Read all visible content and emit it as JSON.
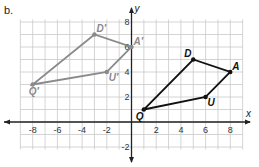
{
  "part_label": "b.",
  "axes": {
    "x_label": "x",
    "y_label": "y",
    "x_ticks": [
      {
        "value": -8,
        "label": "-8"
      },
      {
        "value": -6,
        "label": "-6"
      },
      {
        "value": -4,
        "label": "-4"
      },
      {
        "value": -2,
        "label": "-2"
      },
      {
        "value": 2,
        "label": "2"
      },
      {
        "value": 4,
        "label": "4"
      },
      {
        "value": 6,
        "label": "6"
      },
      {
        "value": 8,
        "label": "8"
      }
    ],
    "y_ticks": [
      {
        "value": 8,
        "label": "8"
      },
      {
        "value": 6,
        "label": "6"
      },
      {
        "value": 4,
        "label": "4"
      },
      {
        "value": 2,
        "label": "2"
      },
      {
        "value": -2,
        "label": "-2"
      }
    ],
    "xlim": [
      -9,
      9
    ],
    "ylim": [
      -2,
      8
    ]
  },
  "figures": [
    {
      "name": "original",
      "color": "#111111",
      "vertices": [
        {
          "label": "Q",
          "x": 1,
          "y": 1
        },
        {
          "label": "U",
          "x": 6,
          "y": 2
        },
        {
          "label": "A",
          "x": 8,
          "y": 4
        },
        {
          "label": "D",
          "x": 5,
          "y": 5
        }
      ]
    },
    {
      "name": "image",
      "color": "#8a8a8a",
      "vertices": [
        {
          "label": "Q′",
          "x": -8,
          "y": 3
        },
        {
          "label": "U′",
          "x": -2,
          "y": 4
        },
        {
          "label": "A′",
          "x": 0,
          "y": 6
        },
        {
          "label": "D′",
          "x": -3,
          "y": 7
        }
      ]
    }
  ]
}
